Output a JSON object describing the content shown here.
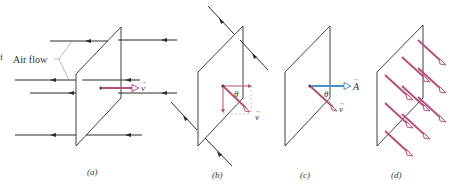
{
  "figure": {
    "panels": [
      {
        "id": "a",
        "caption": "(a)",
        "label_airflow": "Air flow",
        "vector_label": "v"
      },
      {
        "id": "b",
        "caption": "(b)",
        "angle_label": "θ",
        "vector_label": "v"
      },
      {
        "id": "c",
        "caption": "(c)",
        "angle_label": "θ",
        "vector_label": "v",
        "area_label": "A"
      },
      {
        "id": "d",
        "caption": "(d)"
      }
    ],
    "colors": {
      "line": "#2b2b2b",
      "velocity": "#b5517a",
      "area": "#4a90c8",
      "guide": "#999999"
    },
    "edge_mark": "f"
  }
}
